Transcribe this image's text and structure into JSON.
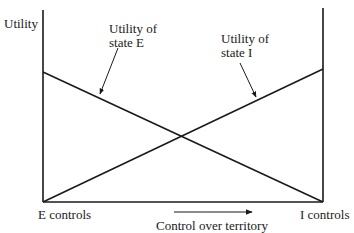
{
  "axes": {
    "y_label": "Utility",
    "x_left_label": "E controls",
    "x_right_label": "I controls",
    "x_title": "Control over territory"
  },
  "annotations": {
    "state_e_line1": "Utility of",
    "state_e_line2": "state E",
    "state_i_line1": "Utility of",
    "state_i_line2": "state I"
  },
  "lines": [
    {
      "name": "Utility of state E",
      "from": "high at E controls",
      "to": "zero at I controls"
    },
    {
      "name": "Utility of state I",
      "from": "zero at E controls",
      "to": "high at I controls"
    }
  ]
}
